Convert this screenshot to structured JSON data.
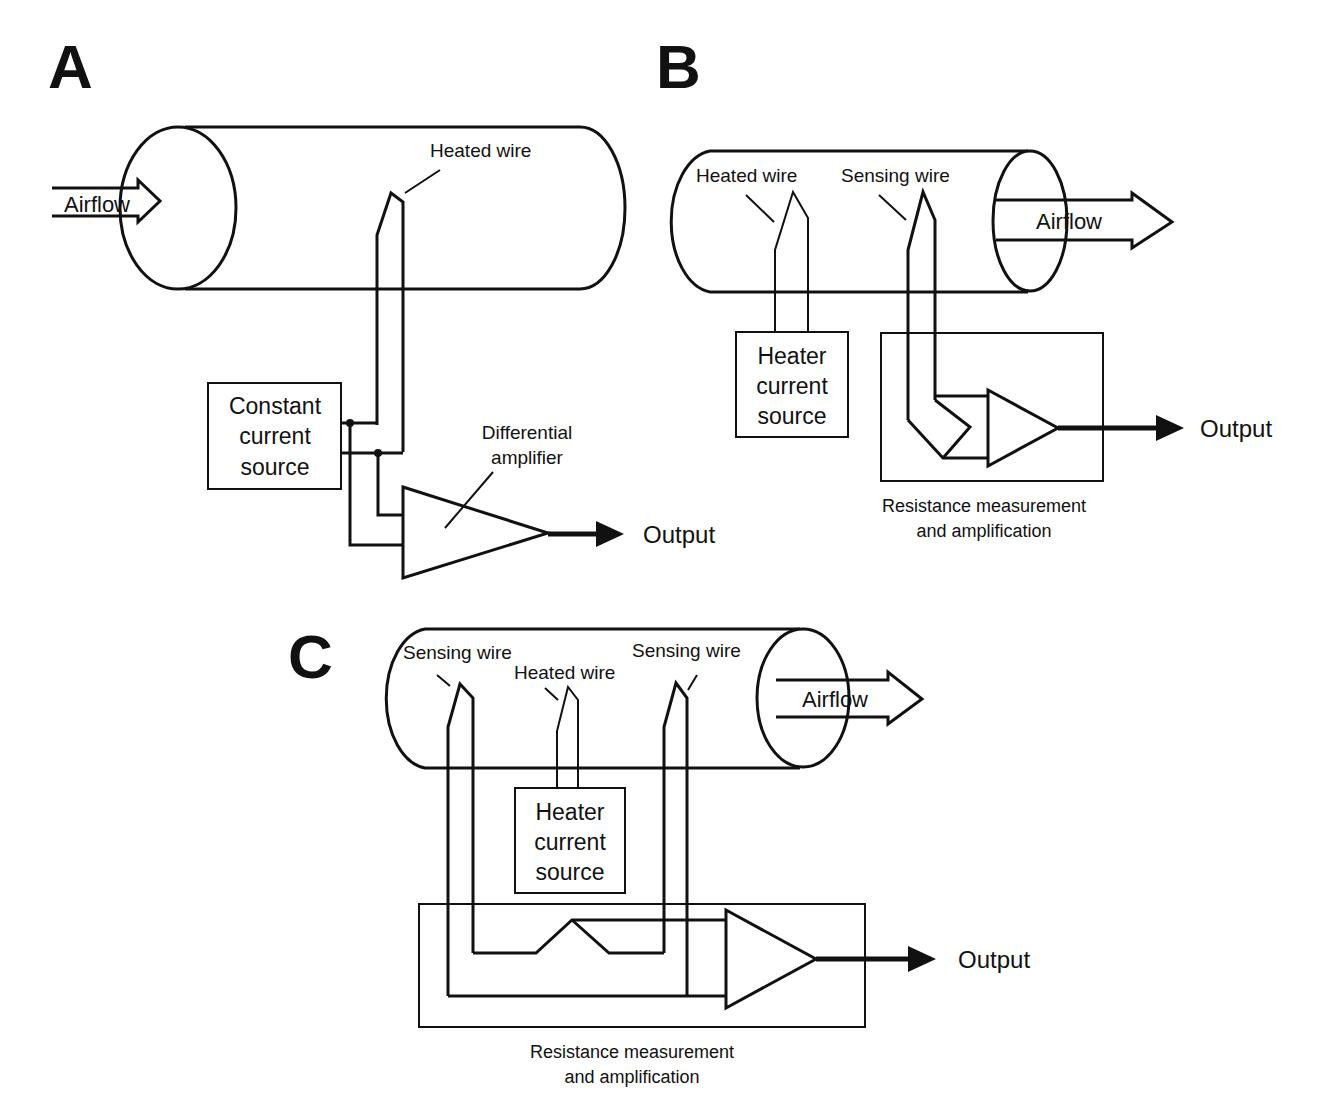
{
  "figure": {
    "panels": [
      {
        "id": "A",
        "label": "A",
        "airflow_label": "Airflow",
        "airflow_direction": "into tube (left)",
        "wires": [
          {
            "label": "Heated wire",
            "role": "heated"
          }
        ],
        "source_box": [
          "Constant",
          "current",
          "source"
        ],
        "amplifier_label": [
          "Differential",
          "amplifier"
        ],
        "output_label": "Output"
      },
      {
        "id": "B",
        "label": "B",
        "airflow_label": "Airflow",
        "airflow_direction": "out of tube (right)",
        "wires": [
          {
            "label": "Heated wire",
            "role": "heated"
          },
          {
            "label": "Sensing wire",
            "role": "sensing"
          }
        ],
        "source_box": [
          "Heater",
          "current",
          "source"
        ],
        "measurement_caption": [
          "Resistance measurement",
          "and amplification"
        ],
        "output_label": "Output"
      },
      {
        "id": "C",
        "label": "C",
        "airflow_label": "Airflow",
        "airflow_direction": "out of tube (right)",
        "wires": [
          {
            "label": "Sensing wire",
            "role": "sensing-upstream"
          },
          {
            "label": "Heated wire",
            "role": "heated"
          },
          {
            "label": "Sensing wire",
            "role": "sensing-downstream"
          }
        ],
        "source_box": [
          "Heater",
          "current",
          "source"
        ],
        "measurement_caption": [
          "Resistance measurement",
          "and amplification"
        ],
        "output_label": "Output"
      }
    ],
    "colors": {
      "ink": "#111111",
      "background": "#ffffff"
    }
  }
}
